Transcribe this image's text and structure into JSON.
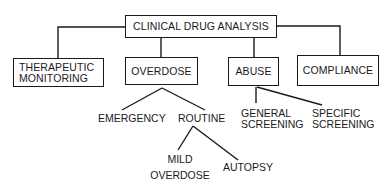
{
  "diagram": {
    "type": "tree",
    "root": {
      "label": "CLINICAL DRUG ANALYSIS"
    },
    "categories": [
      {
        "id": "therapeutic",
        "label_lines": [
          "THERAPEUTIC",
          "MONITORING"
        ]
      },
      {
        "id": "overdose",
        "label_lines": [
          "OVERDOSE"
        ]
      },
      {
        "id": "abuse",
        "label_lines": [
          "ABUSE"
        ]
      },
      {
        "id": "compliance",
        "label_lines": [
          "COMPLIANCE"
        ]
      }
    ],
    "overdose_children": [
      {
        "id": "emergency",
        "label_lines": [
          "EMERGENCY"
        ]
      },
      {
        "id": "routine",
        "label_lines": [
          "ROUTINE"
        ]
      }
    ],
    "routine_children": [
      {
        "id": "mild-overdose",
        "label_lines": [
          "MILD",
          "OVERDOSE"
        ]
      },
      {
        "id": "autopsy",
        "label_lines": [
          "AUTOPSY"
        ]
      }
    ],
    "abuse_children": [
      {
        "id": "general-screening",
        "label_lines": [
          "GENERAL",
          "SCREENING"
        ]
      },
      {
        "id": "specific-screening",
        "label_lines": [
          "SPECIFIC",
          "SCREENING"
        ]
      }
    ],
    "colors": {
      "line": "#1a1a1a",
      "background": "#ffffff"
    }
  }
}
